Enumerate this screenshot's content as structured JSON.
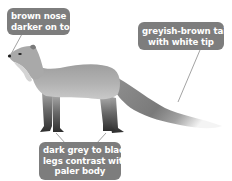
{
  "diagram": {
    "labels": [
      {
        "id": "nose",
        "lines": [
          "brown nose",
          "darker on top"
        ]
      },
      {
        "id": "tail",
        "lines": [
          "greyish-brown tail",
          "with white tip"
        ]
      },
      {
        "id": "legs",
        "lines": [
          "dark grey to black",
          "legs contrast with",
          "paler body"
        ]
      }
    ],
    "colors": {
      "label_bg": "#7d7d7d",
      "label_text": "#ffffff",
      "body": "#a8a8a8",
      "legs": "#3a3a3a",
      "tail_tip": "#f2f2f2",
      "leader_line": "#8a8a8a"
    }
  }
}
